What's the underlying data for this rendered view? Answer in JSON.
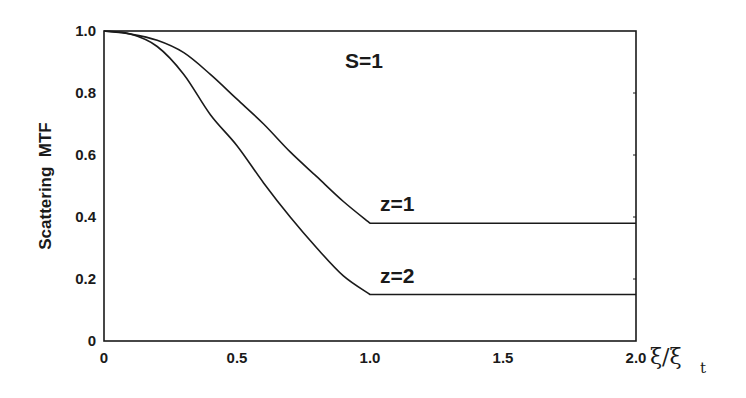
{
  "chart_data": {
    "type": "line",
    "title": "",
    "xlabel": "ξ/ξt",
    "xlabel_main": "ξ/ξ",
    "xlabel_sub": "t",
    "ylabel": "Scattering  MTF",
    "xlim": [
      0,
      2.0
    ],
    "ylim": [
      0,
      1.0
    ],
    "xticks": [
      "0",
      "0.5",
      "1.0",
      "1.5",
      "2.0"
    ],
    "xtick_values": [
      0,
      0.5,
      1.0,
      1.5,
      2.0
    ],
    "yticks": [
      "0",
      "0.2",
      "0.4",
      "0.6",
      "0.8",
      "1.0"
    ],
    "ytick_values": [
      0,
      0.2,
      0.4,
      0.6,
      0.8,
      1.0
    ],
    "grid": false,
    "legend": "none (inline labels)",
    "annotations": [
      {
        "text": "S=1",
        "x": 0.95,
        "y": 0.88
      },
      {
        "text": "z=1",
        "x": 1.0,
        "y": 0.44
      },
      {
        "text": "z=2",
        "x": 1.0,
        "y": 0.2
      }
    ],
    "series": [
      {
        "name": "z=1",
        "x": [
          0,
          0.1,
          0.2,
          0.3,
          0.4,
          0.5,
          0.6,
          0.7,
          0.8,
          0.9,
          1.0,
          2.0
        ],
        "y": [
          1.0,
          0.99,
          0.97,
          0.93,
          0.86,
          0.78,
          0.7,
          0.61,
          0.53,
          0.45,
          0.38,
          0.38
        ]
      },
      {
        "name": "z=2",
        "x": [
          0,
          0.1,
          0.2,
          0.3,
          0.4,
          0.5,
          0.6,
          0.7,
          0.8,
          0.9,
          1.0,
          2.0
        ],
        "y": [
          1.0,
          0.99,
          0.95,
          0.86,
          0.73,
          0.63,
          0.51,
          0.4,
          0.3,
          0.21,
          0.15,
          0.15
        ]
      }
    ]
  }
}
